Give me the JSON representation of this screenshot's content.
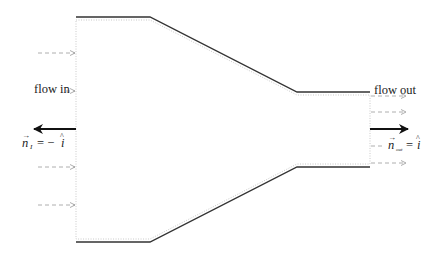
{
  "diagram": {
    "labels": {
      "flow_in": "flow in",
      "flow_out": "flow out",
      "n_in_vec": "n",
      "n_in_sub": "I",
      "n_in_eq": "= −",
      "n_in_unit": "i",
      "n_out_vec": "n",
      "n_out_sub": "out",
      "n_out_eq": "=",
      "n_out_unit": "i"
    },
    "colors": {
      "wall": "#333333",
      "control_volume": "#bbbbbb",
      "flow_arrows": "#999999",
      "normal_arrows": "#111111"
    },
    "geometry": {
      "top_wall": [
        [
          76,
          17
        ],
        [
          150,
          17
        ],
        [
          297,
          92
        ],
        [
          370,
          92
        ]
      ],
      "bottom_wall": [
        [
          76,
          242
        ],
        [
          150,
          242
        ],
        [
          297,
          167
        ],
        [
          370,
          167
        ]
      ],
      "inlet_flow_arrows_y": [
        53,
        91,
        167,
        205
      ],
      "outlet_flow_arrows_y": [
        96,
        112,
        146,
        163
      ]
    }
  }
}
